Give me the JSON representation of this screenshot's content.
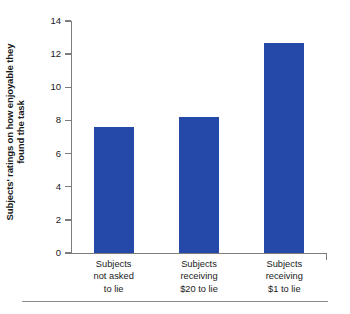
{
  "chart_data": {
    "type": "bar",
    "title": "",
    "xlabel": "",
    "ylabel": "Subjects' ratings on how enjoyable they found the task",
    "ylabel_lines": [
      "Subjects' ratings on how enjoyable they",
      "found the task"
    ],
    "categories": [
      "Subjects not asked to lie",
      "Subjects receiving $20 to lie",
      "Subjects receiving $1 to lie"
    ],
    "category_lines": [
      [
        "Subjects",
        "not asked",
        "to lie"
      ],
      [
        "Subjects",
        "receiving",
        "$20 to lie"
      ],
      [
        "Subjects",
        "receiving",
        "$1 to lie"
      ]
    ],
    "values": [
      7.6,
      8.2,
      12.7
    ],
    "ylim": [
      0,
      14
    ],
    "yticks": [
      0,
      2,
      4,
      6,
      8,
      10,
      12,
      14
    ],
    "ytick_labels": [
      "0",
      "2",
      "4",
      "6",
      "8",
      "10",
      "12",
      "14"
    ],
    "grid": false,
    "legend": false,
    "bar_color": "#2449a8",
    "axis_color": "#7c7c7c",
    "text_color": "#1a1a1a",
    "rule_color": "#8d8d8d"
  }
}
